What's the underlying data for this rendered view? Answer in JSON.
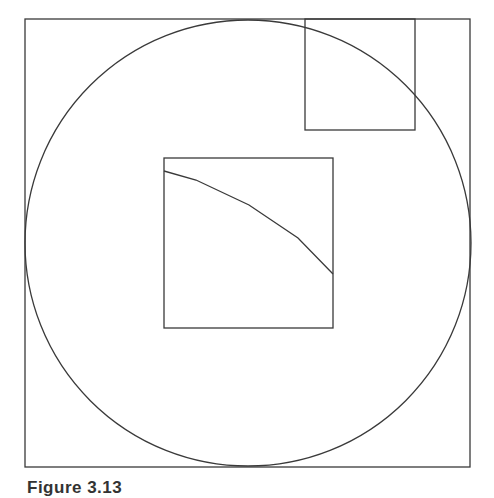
{
  "figure": {
    "caption": "Figure 3.13",
    "stroke_color": "#3a3a3a",
    "background": "#ffffff",
    "outer_square": {
      "x": 25,
      "y": 19,
      "width": 445,
      "height": 448
    },
    "circle": {
      "cx": 248,
      "cy": 243,
      "r": 223
    },
    "corner_square": {
      "x": 305,
      "y": 19,
      "width": 110,
      "height": 111
    },
    "center_square": {
      "x": 164,
      "y": 158,
      "width": 169,
      "height": 170
    },
    "magnified_arc": {
      "points": [
        [
          164,
          171
        ],
        [
          196,
          180
        ],
        [
          249,
          205
        ],
        [
          298,
          238
        ],
        [
          333,
          274
        ]
      ]
    }
  }
}
